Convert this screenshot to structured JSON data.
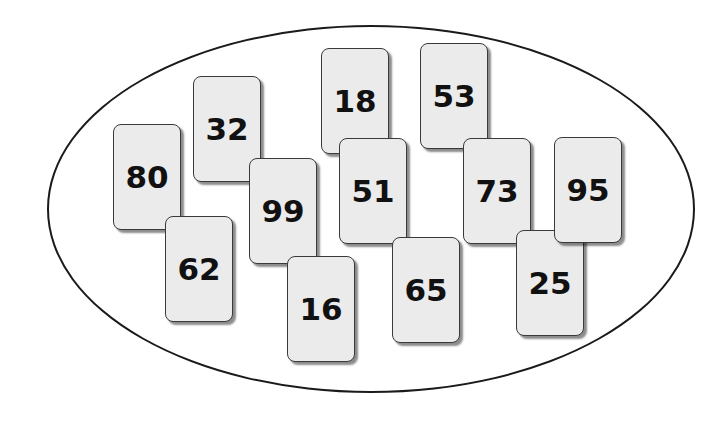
{
  "diagram": {
    "type": "set-of-number-cards",
    "container_shape": "ellipse",
    "cards": [
      {
        "value": "80",
        "x": 113,
        "y": 124,
        "z": 1
      },
      {
        "value": "32",
        "x": 193,
        "y": 76,
        "z": 1
      },
      {
        "value": "18",
        "x": 321,
        "y": 48,
        "z": 1
      },
      {
        "value": "53",
        "x": 420,
        "y": 43,
        "z": 1
      },
      {
        "value": "62",
        "x": 165,
        "y": 216,
        "z": 2
      },
      {
        "value": "99",
        "x": 249,
        "y": 158,
        "z": 2
      },
      {
        "value": "51",
        "x": 339,
        "y": 138,
        "z": 2
      },
      {
        "value": "73",
        "x": 463,
        "y": 138,
        "z": 2
      },
      {
        "value": "16",
        "x": 287,
        "y": 256,
        "z": 3
      },
      {
        "value": "65",
        "x": 392,
        "y": 237,
        "z": 3
      },
      {
        "value": "25",
        "x": 516,
        "y": 230,
        "z": 3
      },
      {
        "value": "95",
        "x": 554,
        "y": 137,
        "z": 4
      }
    ]
  }
}
